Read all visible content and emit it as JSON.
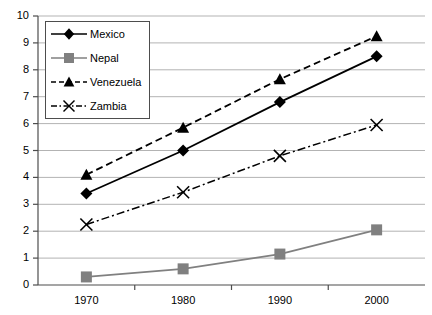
{
  "chart_data": {
    "type": "line",
    "title": "",
    "xlabel": "",
    "ylabel": "",
    "x": [
      1970,
      1980,
      1990,
      2000
    ],
    "categories": [
      "1970",
      "1980",
      "1990",
      "2000"
    ],
    "xtick_labels": [
      "1970",
      "1980",
      "1990",
      "2000"
    ],
    "ytick_labels": [
      "0",
      "1",
      "2",
      "3",
      "4",
      "5",
      "6",
      "7",
      "8",
      "9",
      "10"
    ],
    "ylim": [
      0,
      10
    ],
    "ytick_step": 1,
    "grid": "horizontal",
    "legend_position": "top-left-inside",
    "series": [
      {
        "name": "Mexico",
        "values": [
          3.4,
          5.0,
          6.8,
          8.5
        ],
        "marker": "diamond",
        "line_style": "solid",
        "color": "#000000"
      },
      {
        "name": "Nepal",
        "values": [
          0.3,
          0.6,
          1.15,
          2.05
        ],
        "marker": "square",
        "line_style": "solid",
        "color": "#808080"
      },
      {
        "name": "Venezuela",
        "values": [
          4.1,
          5.85,
          7.65,
          9.25
        ],
        "marker": "triangle",
        "line_style": "dashed",
        "color": "#000000"
      },
      {
        "name": "Zambia",
        "values": [
          2.25,
          3.45,
          4.8,
          5.95
        ],
        "marker": "x",
        "line_style": "dash-dot",
        "color": "#000000"
      }
    ]
  },
  "legend": {
    "items": [
      {
        "label": "Mexico",
        "marker": "diamond-marker",
        "line_style": "solid"
      },
      {
        "label": "Nepal",
        "marker": "square-marker",
        "line_style": "solid"
      },
      {
        "label": "Venezuela",
        "marker": "triangle-marker",
        "line_style": "dashed"
      },
      {
        "label": "Zambia",
        "marker": "x-marker",
        "line_style": "dash-dot"
      }
    ]
  },
  "colors": {
    "axis": "#4d4d4d",
    "gridline": "#b3b3b3",
    "series_dark": "#000000",
    "series_gray": "#808080",
    "background": "#ffffff"
  }
}
